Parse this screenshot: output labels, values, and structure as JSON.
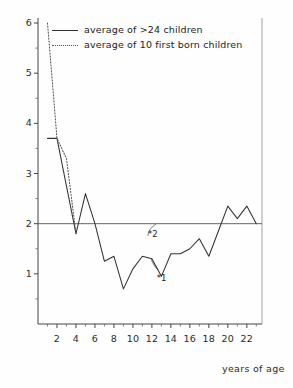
{
  "chart_data": {
    "type": "line",
    "title": "",
    "xlabel": "years of age",
    "ylabel": "",
    "xlim": [
      0,
      23.6
    ],
    "ylim": [
      0,
      6.1
    ],
    "grid": false,
    "legend_position": "top-left",
    "x_ticks": [
      2,
      4,
      6,
      8,
      10,
      12,
      14,
      16,
      18,
      20,
      22
    ],
    "x_tick_labels": [
      "2",
      "4",
      "6",
      "8",
      "10",
      "12",
      "14",
      "16",
      "18",
      "20",
      "22"
    ],
    "x_minor_ticks": [
      1,
      3,
      5,
      7,
      9,
      11,
      13,
      15,
      17,
      19,
      21,
      23
    ],
    "y_ticks": [
      1,
      2,
      3,
      4,
      5,
      6
    ],
    "y_tick_labels": [
      "1",
      "2",
      "3",
      "4",
      "5",
      "6"
    ],
    "y_minor_ticks": [
      0.5,
      1.5,
      2.5,
      3.5,
      4.5,
      5.5
    ],
    "reference_lines": [
      {
        "name": "level-two",
        "orientation": "horizontal",
        "value": 2
      }
    ],
    "series": [
      {
        "name": "average of >24 children",
        "style": "solid",
        "color": "#333333",
        "x": [
          1,
          2,
          3,
          4,
          5,
          6,
          7,
          8,
          9,
          10,
          11,
          12,
          13,
          14,
          15,
          16,
          17,
          18,
          19,
          20,
          21,
          22,
          23
        ],
        "values": [
          3.7,
          3.7,
          2.75,
          1.8,
          2.6,
          2.0,
          1.25,
          1.35,
          0.7,
          1.1,
          1.35,
          1.3,
          0.95,
          1.4,
          1.4,
          1.5,
          1.7,
          1.35,
          1.85,
          2.35,
          2.1,
          2.35,
          2.0
        ]
      },
      {
        "name": "average of 10 first born children",
        "style": "dotted",
        "color": "#555555",
        "x": [
          1,
          2,
          3,
          4
        ],
        "values": [
          6.0,
          3.7,
          3.3,
          1.8
        ]
      }
    ],
    "annotations": [
      {
        "name": "annotation-star-2",
        "label": "*2",
        "x": 11.6,
        "y": 1.78
      },
      {
        "name": "annotation-star-1",
        "label": "*1",
        "x": 12.5,
        "y": 0.9
      }
    ]
  },
  "legend": {
    "items": [
      {
        "label": "average of >24 children",
        "style": "solid"
      },
      {
        "label": "average of 10 first born children",
        "style": "dotted"
      }
    ]
  },
  "axes": {
    "x_title": "years of age"
  },
  "colors": {
    "line_primary": "#333333",
    "line_secondary": "#555555",
    "axis": "#444444",
    "background": "#fefefe"
  }
}
